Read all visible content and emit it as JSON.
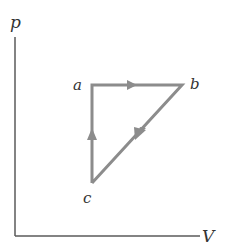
{
  "diagram": {
    "type": "pV-cycle",
    "axes": {
      "y_label": "p",
      "x_label": "V",
      "origin": [
        15,
        236
      ],
      "y_top": 37,
      "x_right": 200,
      "color": "#5a5a5a"
    },
    "points": {
      "a": {
        "label": "a",
        "x": 92,
        "y": 85
      },
      "b": {
        "label": "b",
        "x": 182,
        "y": 85
      },
      "c": {
        "label": "c",
        "x": 92,
        "y": 183
      }
    },
    "paths": [
      {
        "from": "a",
        "to": "b",
        "direction": "right"
      },
      {
        "from": "b",
        "to": "c",
        "direction": "down-left"
      },
      {
        "from": "c",
        "to": "a",
        "direction": "up"
      }
    ],
    "path_color": "#8c8c8c"
  }
}
